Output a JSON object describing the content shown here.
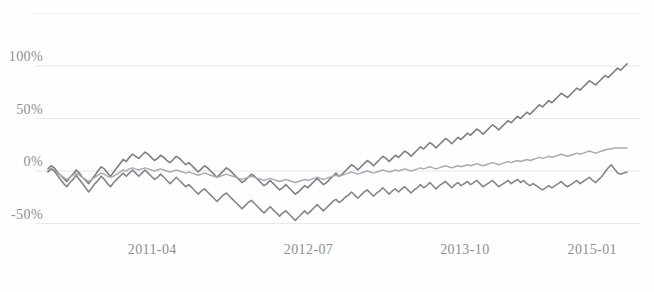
{
  "chart_data": {
    "type": "line",
    "title": "",
    "subtitle": "",
    "xlabel": "",
    "ylabel": "",
    "grid": true,
    "legend_position": "none",
    "x_tick_labels": [
      "2011-04",
      "2012-07",
      "2013-10",
      "2015-01"
    ],
    "x_tick_positions": [
      0.18,
      0.45,
      0.72,
      0.94
    ],
    "y_tick_labels": [
      "-50%",
      "0%",
      "50%",
      "100%"
    ],
    "y_tick_values": [
      -50,
      0,
      50,
      100
    ],
    "ylim": [
      -62,
      152
    ],
    "xlim": [
      0,
      1
    ],
    "series": [
      {
        "name": "series-1",
        "color": "#7b7f84",
        "width": 1.6,
        "values": [
          2,
          5,
          3,
          -1,
          -4,
          -7,
          -10,
          -6,
          -3,
          1,
          -2,
          -6,
          -9,
          -12,
          -8,
          -4,
          0,
          4,
          2,
          -2,
          -5,
          -1,
          3,
          7,
          11,
          9,
          13,
          16,
          14,
          12,
          15,
          18,
          16,
          13,
          10,
          12,
          15,
          13,
          10,
          8,
          11,
          14,
          12,
          9,
          6,
          8,
          5,
          2,
          -1,
          2,
          5,
          3,
          0,
          -3,
          -6,
          -3,
          0,
          3,
          1,
          -2,
          -5,
          -8,
          -11,
          -9,
          -6,
          -3,
          -5,
          -8,
          -11,
          -14,
          -12,
          -9,
          -12,
          -15,
          -18,
          -16,
          -13,
          -16,
          -19,
          -22,
          -20,
          -17,
          -14,
          -16,
          -13,
          -10,
          -7,
          -10,
          -13,
          -11,
          -8,
          -5,
          -2,
          -5,
          -3,
          0,
          3,
          6,
          4,
          1,
          4,
          7,
          10,
          8,
          5,
          8,
          11,
          14,
          12,
          9,
          12,
          15,
          13,
          16,
          19,
          17,
          14,
          17,
          20,
          23,
          21,
          24,
          27,
          25,
          22,
          25,
          28,
          31,
          29,
          26,
          29,
          32,
          30,
          33,
          36,
          34,
          37,
          40,
          38,
          35,
          38,
          41,
          44,
          42,
          39,
          42,
          45,
          48,
          46,
          49,
          52,
          50,
          53,
          56,
          54,
          57,
          60,
          63,
          61,
          64,
          67,
          65,
          68,
          71,
          74,
          72,
          70,
          73,
          76,
          79,
          77,
          80,
          83,
          86,
          84,
          82,
          85,
          88,
          91,
          89,
          92,
          95,
          98,
          96,
          99,
          102
        ]
      },
      {
        "name": "series-2",
        "color": "#a8acb0",
        "width": 1.5,
        "values": [
          0,
          2,
          1,
          -2,
          -4,
          -6,
          -8,
          -6,
          -4,
          -2,
          -4,
          -6,
          -8,
          -10,
          -8,
          -6,
          -4,
          -2,
          -3,
          -5,
          -6,
          -5,
          -3,
          -1,
          1,
          0,
          2,
          3,
          2,
          1,
          2,
          3,
          2,
          1,
          0,
          1,
          2,
          1,
          0,
          -1,
          0,
          1,
          0,
          -1,
          -2,
          -1,
          -2,
          -3,
          -4,
          -3,
          -2,
          -3,
          -4,
          -5,
          -6,
          -5,
          -4,
          -3,
          -4,
          -5,
          -6,
          -7,
          -8,
          -7,
          -6,
          -5,
          -6,
          -7,
          -8,
          -9,
          -8,
          -7,
          -8,
          -9,
          -10,
          -9,
          -8,
          -9,
          -10,
          -11,
          -10,
          -9,
          -8,
          -9,
          -8,
          -7,
          -6,
          -7,
          -8,
          -7,
          -6,
          -5,
          -4,
          -5,
          -4,
          -3,
          -2,
          -1,
          -2,
          -3,
          -2,
          -1,
          0,
          -1,
          -2,
          -1,
          0,
          1,
          0,
          -1,
          0,
          1,
          0,
          1,
          2,
          1,
          0,
          1,
          2,
          3,
          2,
          3,
          4,
          3,
          2,
          3,
          4,
          5,
          4,
          3,
          4,
          5,
          4,
          5,
          6,
          5,
          6,
          7,
          6,
          5,
          6,
          7,
          8,
          7,
          6,
          7,
          8,
          9,
          8,
          9,
          10,
          9,
          10,
          11,
          10,
          11,
          12,
          13,
          12,
          13,
          14,
          13,
          14,
          15,
          16,
          15,
          14,
          15,
          16,
          17,
          16,
          17,
          18,
          19,
          18,
          17,
          18,
          19,
          20,
          21,
          21,
          22,
          22,
          22,
          22,
          22
        ]
      },
      {
        "name": "series-3",
        "color": "#82868b",
        "width": 1.6,
        "values": [
          -1,
          2,
          0,
          -4,
          -8,
          -12,
          -15,
          -11,
          -8,
          -4,
          -8,
          -12,
          -16,
          -20,
          -16,
          -12,
          -9,
          -5,
          -8,
          -12,
          -15,
          -11,
          -8,
          -5,
          -2,
          -5,
          -2,
          1,
          -2,
          -5,
          -2,
          1,
          -2,
          -5,
          -8,
          -6,
          -3,
          -6,
          -9,
          -12,
          -9,
          -6,
          -9,
          -12,
          -15,
          -13,
          -16,
          -19,
          -22,
          -19,
          -17,
          -20,
          -23,
          -26,
          -29,
          -26,
          -23,
          -21,
          -24,
          -27,
          -30,
          -33,
          -36,
          -33,
          -30,
          -28,
          -31,
          -34,
          -37,
          -40,
          -37,
          -34,
          -37,
          -40,
          -43,
          -40,
          -38,
          -41,
          -44,
          -47,
          -44,
          -41,
          -38,
          -41,
          -38,
          -35,
          -32,
          -35,
          -38,
          -35,
          -32,
          -29,
          -27,
          -30,
          -28,
          -25,
          -23,
          -20,
          -23,
          -26,
          -23,
          -20,
          -18,
          -21,
          -24,
          -21,
          -19,
          -16,
          -19,
          -22,
          -19,
          -17,
          -20,
          -17,
          -15,
          -18,
          -21,
          -18,
          -16,
          -13,
          -16,
          -14,
          -11,
          -14,
          -17,
          -14,
          -12,
          -10,
          -13,
          -16,
          -13,
          -11,
          -14,
          -12,
          -10,
          -13,
          -11,
          -9,
          -12,
          -15,
          -13,
          -11,
          -9,
          -12,
          -15,
          -13,
          -11,
          -9,
          -12,
          -10,
          -8,
          -11,
          -9,
          -12,
          -14,
          -12,
          -14,
          -16,
          -18,
          -16,
          -14,
          -16,
          -14,
          -12,
          -10,
          -13,
          -15,
          -13,
          -11,
          -9,
          -12,
          -10,
          -8,
          -6,
          -9,
          -11,
          -8,
          -5,
          -1,
          3,
          6,
          2,
          -2,
          -3,
          -2,
          -1
        ]
      }
    ]
  }
}
